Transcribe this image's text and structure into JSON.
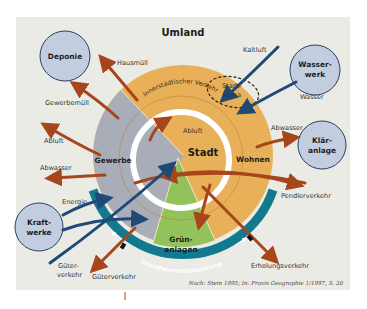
{
  "diagram": {
    "title": "Umland",
    "center_label": "Stadt",
    "sectors": [
      {
        "id": "gewerbe",
        "label": "Gewerbe",
        "color": "#a9adb8"
      },
      {
        "id": "wohnen",
        "label": "Wohnen",
        "color": "#e9b05a"
      },
      {
        "id": "gruenanlagen",
        "label_line1": "Grün-",
        "label_line2": "anlagen",
        "color": "#93c15a"
      }
    ],
    "ring_labels": {
      "innerstaedtischer_verkehr": "Innerstädtischer Verkehr",
      "grundwasserabsenkung": "Grundwasserabsenkung",
      "stadtklima_line1": "Stadt-",
      "stadtklima_line2": "klima",
      "abluft_inner": "Abluft"
    },
    "facilities": [
      {
        "id": "deponie",
        "label_line1": "Deponie",
        "label_line2": ""
      },
      {
        "id": "wasserwerk",
        "label_line1": "Wasser-",
        "label_line2": "werk"
      },
      {
        "id": "klaeranlage",
        "label_line1": "Klär-",
        "label_line2": "anlage"
      },
      {
        "id": "kraftwerke",
        "label_line1": "Kraft-",
        "label_line2": "werke"
      }
    ],
    "flows": {
      "hausmuell": "Hausmüll",
      "gewerbemuell": "Gewerbemüll",
      "abluft": "Abluft",
      "abwasser_left": "Abwasser",
      "energie": "Energie",
      "gueterverkehr_left_line1": "Güter-",
      "gueterverkehr_left_line2": "verkehr",
      "gueterverkehr": "Güterverkehr",
      "kaltluft": "Kaltluft",
      "wasser": "Wasser",
      "abwasser_right": "Abwasser",
      "pendlerverkehr": "Pendlerverkehr",
      "erholungsverkehr": "Erholungsverkehr"
    },
    "source": "Nach: Stein 1995; In: Praxis Geographie 1/1997, S. 20",
    "colors": {
      "background": "#ebebe6",
      "facility_fill": "#c3cde0",
      "facility_stroke": "#2d3f63",
      "outflow_arrow": "#a7461c",
      "inflow_arrow": "#1f4a78",
      "groundwater_ring": "#127a8f"
    }
  }
}
